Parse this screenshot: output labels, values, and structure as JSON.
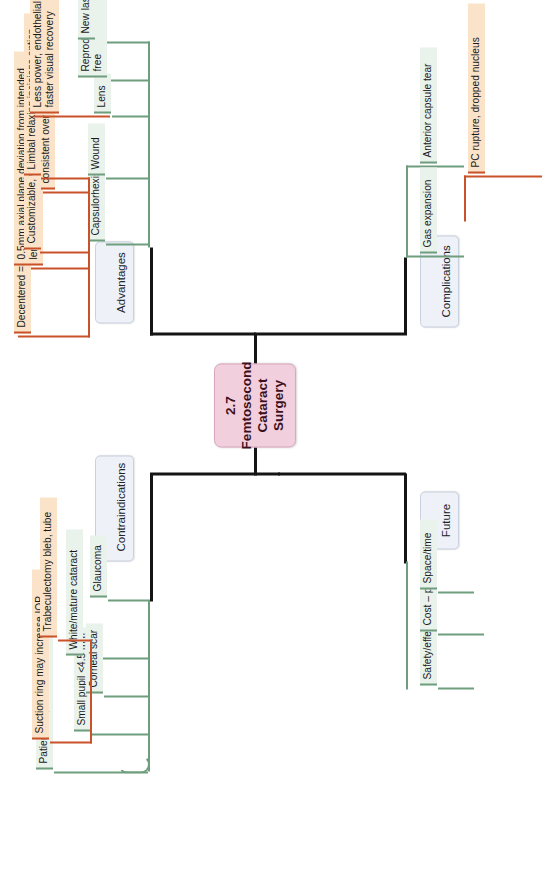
{
  "diagram": {
    "type": "mind-map",
    "orientation": "rotated-90-ccw",
    "root": {
      "label": "2.7 Femtosecond Cataract Surgery",
      "color": "#f2cfdc"
    },
    "palette": {
      "root_fill": "#f2cfdc",
      "category_fill": "#eef1f7",
      "level2_fill": "#eaf2ec",
      "level2_rule": "#6f9e7e",
      "level3_fill": "#fae3c8",
      "level3_rule": "#c9522a",
      "trunk": "#151515"
    },
    "branches": [
      {
        "label": "Contraindications",
        "children": [
          {
            "label": "Patient cooperation/movement"
          },
          {
            "label": "Small pupil <4.5 mm"
          },
          {
            "label": "Corneal scar"
          },
          {
            "label": "White/mature cataract"
          },
          {
            "label": "Glaucoma",
            "children": [
              {
                "label": "Suction ring may increase IOP"
              },
              {
                "label": "Trabeculectomy bleb, tube"
              }
            ]
          }
        ]
      },
      {
        "label": "Advantages",
        "children": [
          {
            "label": "Capsulorhexis",
            "children": [
              {
                "label": "Decentered => optic tilt. Small => phimosis"
              },
              {
                "label": "0.5mm axial plane deviation from intended lens position => +/–1D RE"
              },
              {
                "label": "Size, diameter, roundness consistent over time"
              }
            ]
          },
          {
            "label": "Wound",
            "children": [
              {
                "label": "Customizable, water-tight"
              },
              {
                "label": "Limbal relaxing incisions option"
              }
            ]
          },
          {
            "label": "Lens",
            "children": [
              {
                "label": "Less power, endothelial cell loss, faster visual recovery"
              }
            ]
          },
          {
            "label": "Reproducible, blade-free"
          },
          {
            "label": "New laser technology"
          }
        ]
      },
      {
        "label": "Future",
        "children": [
          {
            "label": "Safety/effectiveness/better?"
          },
          {
            "label": "Cost – patient/public"
          },
          {
            "label": "Space/time"
          }
        ]
      },
      {
        "label": "Complications",
        "children": [
          {
            "label": "Gas expansion",
            "children": [
              {
                "label": "PC rupture, dropped nucleus"
              }
            ]
          },
          {
            "label": "Anterior capsule tear"
          }
        ]
      }
    ]
  }
}
